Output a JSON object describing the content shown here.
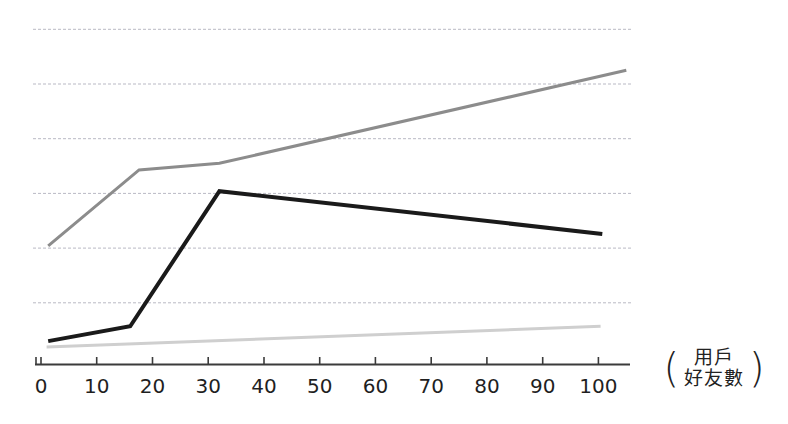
{
  "chart_data": {
    "type": "line",
    "title": "",
    "subtitle": "",
    "xlabel": "用戶好友數",
    "xlabel_prefix": "(",
    "xlabel_suffix": ")",
    "xlabel_line1": "用戶",
    "xlabel_line2": "好友數",
    "ylabel": "",
    "xlim": [
      0,
      105
    ],
    "ylim": [
      0,
      6.5
    ],
    "xticks": [
      0,
      10,
      20,
      30,
      40,
      50,
      60,
      70,
      80,
      90,
      100
    ],
    "xticklabels": [
      "0",
      "10",
      "20",
      "30",
      "40",
      "50",
      "60",
      "70",
      "80",
      "90",
      "100"
    ],
    "yticks": [],
    "yticklabels": [],
    "grid": true,
    "grid_style": "dashed-horizontal",
    "grid_color": "#b9b9c4",
    "gridline_values": [
      1.0,
      2.0,
      3.0,
      4.0,
      5.0,
      6.0
    ],
    "legend": "none",
    "axis_color": "#3b3b3b",
    "background": "#ffffff",
    "series": [
      {
        "name": "series-dark-gray",
        "color": "#8c8c8c",
        "width": 3,
        "x": [
          1.3,
          17.6,
          32.0,
          105.0
        ],
        "y": [
          2.04,
          3.43,
          3.55,
          5.25
        ]
      },
      {
        "name": "series-black",
        "color": "#1a1a1a",
        "width": 4,
        "x": [
          1.3,
          16.0,
          32.0,
          100.7
        ],
        "y": [
          0.3,
          0.57,
          3.04,
          2.26
        ]
      },
      {
        "name": "series-light-gray",
        "color": "#cfcfcf",
        "width": 3,
        "x": [
          1.0,
          100.4
        ],
        "y": [
          0.19,
          0.57
        ]
      }
    ]
  }
}
